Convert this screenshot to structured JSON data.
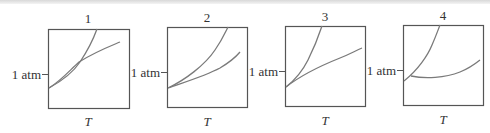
{
  "figure": {
    "panels": [
      {
        "title": "1",
        "y_tick_label": "1 atm",
        "x_label": "T",
        "description": "Two curves cross inside the box above the bottom-left; steep curve and shallower curve intersect near 1 atm"
      },
      {
        "title": "2",
        "y_tick_label": "1 atm",
        "x_label": "T",
        "description": "Two curves meet near the left edge below 1 atm and diverge"
      },
      {
        "title": "3",
        "y_tick_label": "1 atm",
        "x_label": "T",
        "description": "Two curves meet slightly inside the left edge below 1 atm; one steep, one nearly linear"
      },
      {
        "title": "4",
        "y_tick_label": "1 atm",
        "x_label": "T",
        "description": "Steep curve from left edge below 1 atm; second curve dips then rises"
      }
    ],
    "colors": {
      "frame": "#555555",
      "curve": "#7a7a7a",
      "text": "#333333"
    }
  }
}
